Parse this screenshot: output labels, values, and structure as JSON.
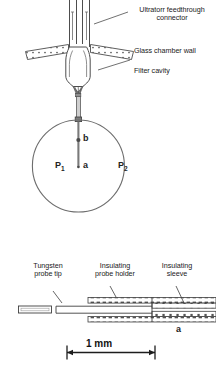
{
  "figure": {
    "title_absent": true,
    "upper_diagram": {
      "callouts": [
        {
          "name": "ultratorr-feedthrough-connector",
          "line1": "Ultratorr feedthrough",
          "line2": "connector"
        },
        {
          "name": "glass-chamber-wall",
          "line1": "Glass chamber wall",
          "line2": ""
        },
        {
          "name": "filter-cavity",
          "line1": "Filter cavity",
          "line2": ""
        }
      ],
      "symbols": [
        {
          "name": "pressure-p1",
          "base": "P",
          "sub": "1"
        },
        {
          "name": "pressure-p2",
          "base": "P",
          "sub": "2"
        },
        {
          "name": "point-a",
          "base": "a",
          "sub": ""
        },
        {
          "name": "point-b",
          "base": "b",
          "sub": ""
        }
      ]
    },
    "lower_diagram": {
      "callouts": [
        {
          "name": "tungsten-probe-tip",
          "line1": "Tungsten",
          "line2": "probe tip"
        },
        {
          "name": "insulating-probe-holder",
          "line1": "Insulating",
          "line2": "probe holder"
        },
        {
          "name": "insulating-sleeve",
          "line1": "Insulating",
          "line2": "sleeve"
        }
      ],
      "symbols": [
        {
          "name": "dimension-a",
          "base": "a",
          "sub": ""
        }
      ],
      "scale_bar": {
        "name": "scale-bar",
        "label": "1 mm"
      }
    },
    "colors": {
      "stroke": "#4d4d4d",
      "stroke_dark": "#2b2b2b",
      "text": "#1a1a1a",
      "background": "#ffffff",
      "hatch": "#555555"
    }
  }
}
